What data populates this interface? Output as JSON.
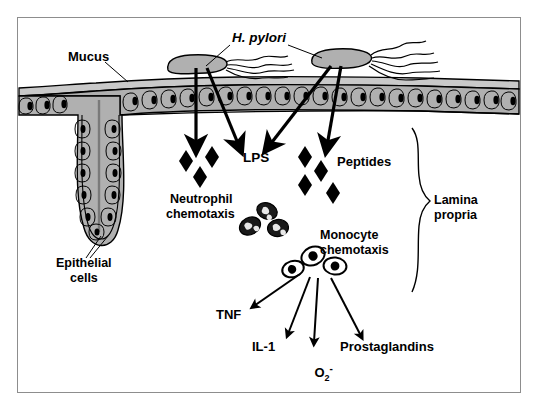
{
  "figure": {
    "title_visible": false,
    "background": "#ffffff",
    "border_color": "#8d8d8d",
    "ink_color": "#000000",
    "tissue_fill": "#b0b0b0",
    "mucus_fill": "#c9c9c9",
    "cell_fill": "#bdbdbd"
  },
  "labels": {
    "h_pylori": "H. pylori",
    "mucus": "Mucus",
    "epithelial_cells_line1": "Epithelial",
    "epithelial_cells_line2": "cells",
    "lps": "LPS",
    "peptides": "Peptides",
    "neutrophil_line1": "Neutrophil",
    "neutrophil_line2": "chemotaxis",
    "monocyte_line1": "Monocyte",
    "monocyte_line2": "chemotaxis",
    "lamina_line1": "Lamina",
    "lamina_line2": "propria",
    "tnf": "TNF",
    "il1": "IL-1",
    "superoxide_base": "O",
    "superoxide_sub": "2",
    "superoxide_sup": "-",
    "prostaglandins": "Prostaglandins"
  },
  "diagram_elements": {
    "bacteria": [
      {
        "name": "h-pylori-left",
        "x": 196,
        "y": 62,
        "length": 58,
        "flagella": 4
      },
      {
        "name": "h-pylori-right",
        "x": 340,
        "y": 57,
        "length": 58,
        "flagella": 5
      }
    ],
    "invasion_arrows": [
      {
        "name": "arrow-lps-vertical",
        "from": [
          196,
          66
        ],
        "to": [
          196,
          148
        ]
      },
      {
        "name": "arrow-lps-diagonal",
        "from": [
          206,
          66
        ],
        "to": [
          238,
          148
        ]
      },
      {
        "name": "arrow-peptide-diagonal",
        "from": [
          330,
          62
        ],
        "to": [
          268,
          148
        ]
      },
      {
        "name": "arrow-peptide-vertical",
        "from": [
          340,
          62
        ],
        "to": [
          326,
          148
        ]
      }
    ],
    "lps_diamonds": [
      {
        "x": 186,
        "y": 160
      },
      {
        "x": 212,
        "y": 155
      },
      {
        "x": 200,
        "y": 176
      }
    ],
    "peptide_diamonds": [
      {
        "x": 305,
        "y": 155
      },
      {
        "x": 320,
        "y": 168
      },
      {
        "x": 305,
        "y": 181
      },
      {
        "x": 330,
        "y": 189
      }
    ],
    "neutrophils": [
      {
        "x": 250,
        "y": 225
      },
      {
        "x": 266,
        "y": 212
      },
      {
        "x": 276,
        "y": 228
      }
    ],
    "monocytes": [
      {
        "x": 294,
        "y": 268
      },
      {
        "x": 312,
        "y": 256
      },
      {
        "x": 334,
        "y": 266
      }
    ],
    "mediator_arrows": [
      {
        "name": "arrow-tnf",
        "from": [
          300,
          272
        ],
        "to": [
          252,
          305
        ]
      },
      {
        "name": "arrow-il1",
        "from": [
          310,
          274
        ],
        "to": [
          286,
          336
        ]
      },
      {
        "name": "arrow-superoxide",
        "from": [
          318,
          276
        ],
        "to": [
          314,
          344
        ]
      },
      {
        "name": "arrow-prostaglandins",
        "from": [
          330,
          276
        ],
        "to": [
          362,
          338
        ]
      }
    ],
    "lamina_brace": {
      "x": 420,
      "top": 128,
      "bottom": 292
    },
    "epithelium_band": {
      "top": 82,
      "bottom": 112
    },
    "gastric_pit": {
      "center_x": 100,
      "depth": 168
    }
  }
}
